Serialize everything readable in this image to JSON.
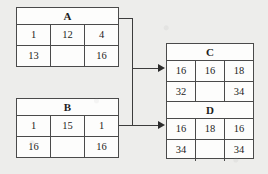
{
  "diagram": {
    "line_color": "#3c3c3c",
    "background_color": "#ededeb",
    "table_fill": "#fdfdfc"
  },
  "tables": [
    {
      "id": "A",
      "header": "A",
      "rows": [
        [
          "1",
          "12",
          "4"
        ],
        [
          "13",
          "",
          "16"
        ]
      ]
    },
    {
      "id": "B",
      "header": "B",
      "rows": [
        [
          "1",
          "15",
          "1"
        ],
        [
          "16",
          "",
          "16"
        ]
      ]
    },
    {
      "id": "C",
      "header": "C",
      "rows": [
        [
          "16",
          "16",
          "18"
        ],
        [
          "32",
          "",
          "34"
        ]
      ]
    },
    {
      "id": "D",
      "header": "D",
      "rows": [
        [
          "16",
          "18",
          "16"
        ],
        [
          "34",
          "",
          "34"
        ]
      ]
    }
  ],
  "connections": [
    {
      "from": "A",
      "to": "C",
      "arrow": "right"
    },
    {
      "from": "A",
      "to": "D",
      "arrow": "right"
    },
    {
      "from": "B",
      "to": "C",
      "arrow": "right"
    },
    {
      "from": "B",
      "to": "D",
      "arrow": "right"
    }
  ]
}
